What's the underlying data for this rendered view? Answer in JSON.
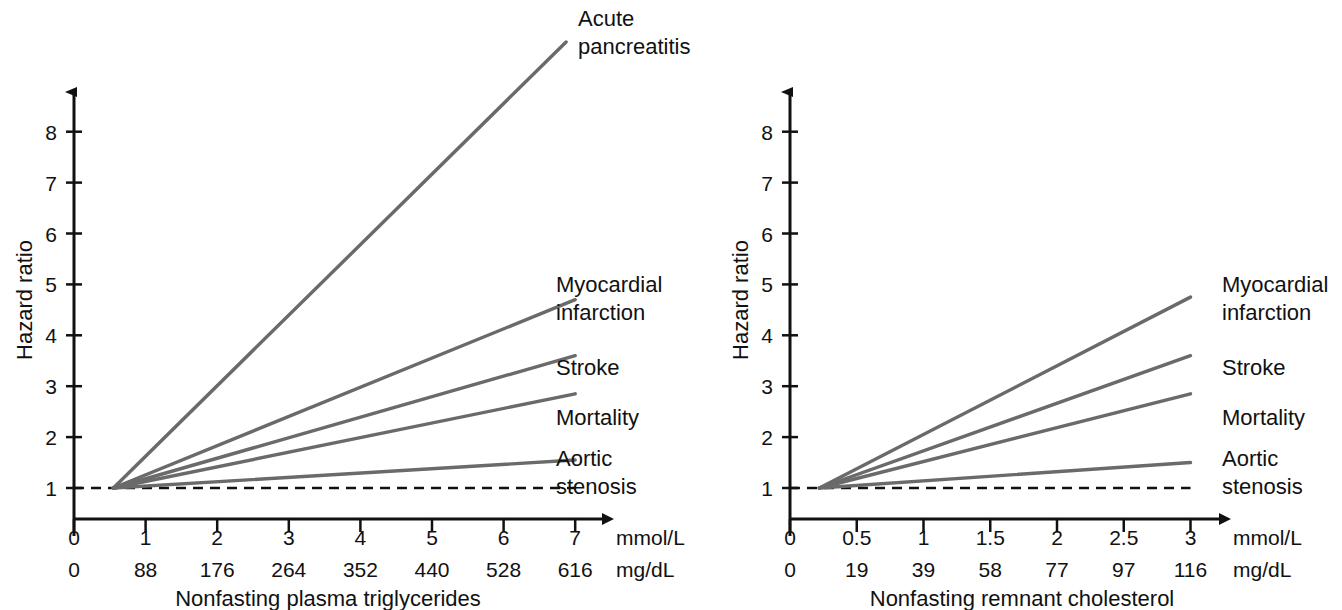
{
  "figure": {
    "background": "#ffffff",
    "line_color": "#6a6a6a",
    "axis_color": "#111111"
  },
  "panels": [
    {
      "id": "left",
      "caption": "Nonfasting plasma triglycerides",
      "y_axis": {
        "label": "Hazard ratio",
        "ticks": [
          "1",
          "2",
          "3",
          "4",
          "5",
          "6",
          "7",
          "8"
        ],
        "min": 1,
        "max": 8.6
      },
      "x_axis": {
        "primary_unit": "mmol/L",
        "secondary_unit": "mg/dL",
        "primary_ticks": [
          "0",
          "1",
          "2",
          "3",
          "4",
          "5",
          "6",
          "7"
        ],
        "secondary_ticks": [
          "0",
          "88",
          "176",
          "264",
          "352",
          "440",
          "528",
          "616"
        ],
        "min": 0,
        "max": 7
      },
      "reference_line": 1,
      "series": [
        {
          "name": "Acute pancreatitis",
          "label_lines": [
            "Acute",
            "pancreatitis"
          ],
          "x_start": 0.55,
          "x_end": 6.9,
          "y_start": 1.0,
          "y_end": 9.8
        },
        {
          "name": "Myocardial infarction",
          "label_lines": [
            "Myocardial",
            "infarction"
          ],
          "x_start": 0.55,
          "x_end": 7.0,
          "y_start": 1.0,
          "y_end": 4.7
        },
        {
          "name": "Stroke",
          "label_lines": [
            "Stroke"
          ],
          "x_start": 0.55,
          "x_end": 7.0,
          "y_start": 1.0,
          "y_end": 3.6
        },
        {
          "name": "Mortality",
          "label_lines": [
            "Mortality"
          ],
          "x_start": 0.55,
          "x_end": 7.0,
          "y_start": 1.0,
          "y_end": 2.85
        },
        {
          "name": "Aortic stenosis",
          "label_lines": [
            "Aortic",
            "stenosis"
          ],
          "x_start": 0.55,
          "x_end": 7.0,
          "y_start": 1.0,
          "y_end": 1.55
        }
      ]
    },
    {
      "id": "right",
      "caption": "Nonfasting remnant cholesterol",
      "y_axis": {
        "label": "Hazard ratio",
        "ticks": [
          "1",
          "2",
          "3",
          "4",
          "5",
          "6",
          "7",
          "8"
        ],
        "min": 1,
        "max": 8.6
      },
      "x_axis": {
        "primary_unit": "mmol/L",
        "secondary_unit": "mg/dL",
        "primary_ticks": [
          "0",
          "0.5",
          "1",
          "1.5",
          "2",
          "2.5",
          "3"
        ],
        "secondary_ticks": [
          "0",
          "19",
          "39",
          "58",
          "77",
          "97",
          "116"
        ],
        "min": 0,
        "max": 3
      },
      "reference_line": 1,
      "series": [
        {
          "name": "Myocardial infarction",
          "label_lines": [
            "Myocardial",
            "infarction"
          ],
          "x_start": 0.22,
          "x_end": 3.0,
          "y_start": 1.0,
          "y_end": 4.75
        },
        {
          "name": "Stroke",
          "label_lines": [
            "Stroke"
          ],
          "x_start": 0.22,
          "x_end": 3.0,
          "y_start": 1.0,
          "y_end": 3.6
        },
        {
          "name": "Mortality",
          "label_lines": [
            "Mortality"
          ],
          "x_start": 0.22,
          "x_end": 3.0,
          "y_start": 1.0,
          "y_end": 2.85
        },
        {
          "name": "Aortic stenosis",
          "label_lines": [
            "Aortic",
            "stenosis"
          ],
          "x_start": 0.22,
          "x_end": 3.0,
          "y_start": 1.0,
          "y_end": 1.5
        }
      ]
    }
  ],
  "chart_data": {
    "type": "line",
    "title": "",
    "panel_count": 2,
    "charts": [
      {
        "panel": "left",
        "xlabel": "Nonfasting plasma triglycerides",
        "ylabel": "Hazard ratio",
        "x_unit_primary": "mmol/L",
        "x_unit_secondary": "mg/dL",
        "xticks_mmol": [
          0,
          1,
          2,
          3,
          4,
          5,
          6,
          7
        ],
        "xticks_mgdl": [
          0,
          88,
          176,
          264,
          352,
          440,
          528,
          616
        ],
        "yticks": [
          1,
          2,
          3,
          4,
          5,
          6,
          7,
          8
        ],
        "xlim": [
          0,
          7
        ],
        "ylim": [
          1,
          8.6
        ],
        "grid": false,
        "reference_line_y": 1,
        "series": [
          {
            "name": "Acute pancreatitis",
            "x": [
              0.55,
              6.9
            ],
            "values": [
              1.0,
              9.8
            ]
          },
          {
            "name": "Myocardial infarction",
            "x": [
              0.55,
              7.0
            ],
            "values": [
              1.0,
              4.7
            ]
          },
          {
            "name": "Stroke",
            "x": [
              0.55,
              7.0
            ],
            "values": [
              1.0,
              3.6
            ]
          },
          {
            "name": "Mortality",
            "x": [
              0.55,
              7.0
            ],
            "values": [
              1.0,
              2.85
            ]
          },
          {
            "name": "Aortic stenosis",
            "x": [
              0.55,
              7.0
            ],
            "values": [
              1.0,
              1.55
            ]
          }
        ]
      },
      {
        "panel": "right",
        "xlabel": "Nonfasting remnant cholesterol",
        "ylabel": "Hazard ratio",
        "x_unit_primary": "mmol/L",
        "x_unit_secondary": "mg/dL",
        "xticks_mmol": [
          0,
          0.5,
          1,
          1.5,
          2,
          2.5,
          3
        ],
        "xticks_mgdl": [
          0,
          19,
          39,
          58,
          77,
          97,
          116
        ],
        "yticks": [
          1,
          2,
          3,
          4,
          5,
          6,
          7,
          8
        ],
        "xlim": [
          0,
          3
        ],
        "ylim": [
          1,
          8.6
        ],
        "grid": false,
        "reference_line_y": 1,
        "series": [
          {
            "name": "Myocardial infarction",
            "x": [
              0.22,
              3.0
            ],
            "values": [
              1.0,
              4.75
            ]
          },
          {
            "name": "Stroke",
            "x": [
              0.22,
              3.0
            ],
            "values": [
              1.0,
              3.6
            ]
          },
          {
            "name": "Mortality",
            "x": [
              0.22,
              3.0
            ],
            "values": [
              1.0,
              2.85
            ]
          },
          {
            "name": "Aortic stenosis",
            "x": [
              0.22,
              3.0
            ],
            "values": [
              1.0,
              1.5
            ]
          }
        ]
      }
    ]
  }
}
